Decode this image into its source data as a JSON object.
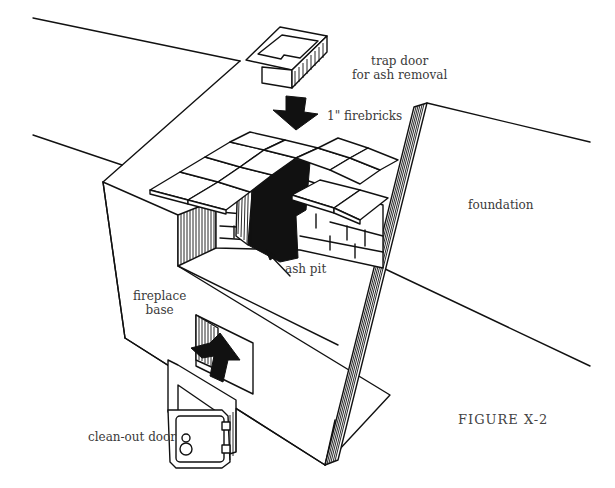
{
  "figure": {
    "caption": "FIGURE X-2",
    "labels": {
      "trap_door_line1": "trap door",
      "trap_door_line2": "for ash removal",
      "firebricks": "1\" firebricks",
      "foundation": "foundation",
      "ash_pit": "ash pit",
      "fireplace_base_line1": "fireplace",
      "fireplace_base_line2": "base",
      "clean_out_door": "clean-out door"
    },
    "colors": {
      "ink": "#111111",
      "label_text": "#3a3a3a",
      "background": "#ffffff"
    }
  }
}
